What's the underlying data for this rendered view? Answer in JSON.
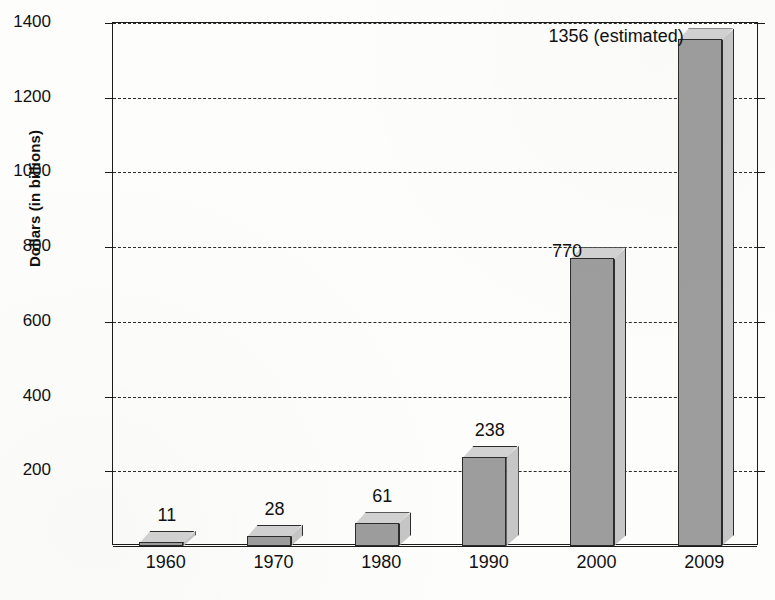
{
  "chart_data": {
    "type": "bar",
    "title": "",
    "xlabel": "",
    "ylabel": "Dollars (in billions)",
    "categories": [
      "1960",
      "1970",
      "1980",
      "1990",
      "2000",
      "2009"
    ],
    "values": [
      11,
      28,
      61,
      238,
      770,
      1356
    ],
    "value_labels": [
      "11",
      "28",
      "61",
      "238",
      "770",
      "1356 (estimated)"
    ],
    "ylim": [
      0,
      1400
    ],
    "yticks": [
      200,
      400,
      600,
      800,
      1000,
      1200,
      1400
    ],
    "ytick_labels": [
      "200",
      "400",
      "600",
      "800",
      "1000",
      "1200",
      "1400"
    ],
    "grid": true,
    "grid_style": "dashed-horizontal",
    "legend": "none",
    "style": "3d-bar",
    "colors": {
      "bar_front": "#9d9d9d",
      "bar_top": "#d2d2d2",
      "bar_side": "#c6c6c6",
      "outline": "#2c2c2c",
      "axis": "#1b1b1b",
      "grid": "#2a2a2a",
      "background": "#fdfdfc",
      "text": "#111111"
    }
  }
}
